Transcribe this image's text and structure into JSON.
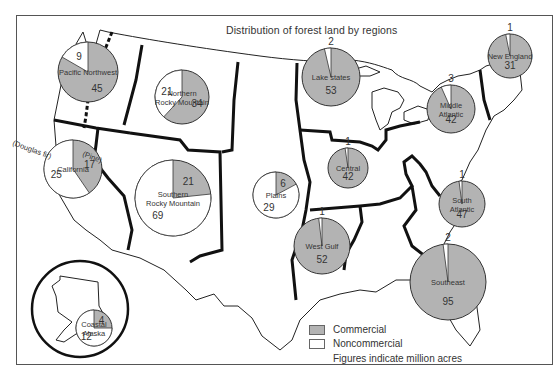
{
  "title": "Distribution of forest  land by regions",
  "legend": {
    "commercial_label": "Commercial",
    "noncommercial_label": "Noncommercial",
    "note": "Figures indicate million acres",
    "commercial_color": "#b3b3b3",
    "noncommercial_color": "#ffffff"
  },
  "annotations": {
    "douglas_fir": "(Douglas fir)",
    "pine": "(Pine)"
  },
  "chart_data": {
    "type": "pie",
    "title": "Distribution of forest land by regions",
    "units": "million acres",
    "legend": [
      "Commercial",
      "Noncommercial"
    ],
    "regions": [
      {
        "name": "Pacific Northwest",
        "label_lines": [
          "Pacific Northwest"
        ],
        "commercial": 45,
        "noncommercial": 9,
        "cx": 88,
        "cy": 72,
        "r": 30
      },
      {
        "name": "Northern Rocky Mountain",
        "label_lines": [
          "Northern",
          "Rocky Mountain"
        ],
        "commercial": 34,
        "noncommercial": 21,
        "cx": 182,
        "cy": 97,
        "r": 27
      },
      {
        "name": "Lake states",
        "label_lines": [
          "Lake states"
        ],
        "commercial": 53,
        "noncommercial": 2,
        "cx": 331,
        "cy": 77,
        "r": 29
      },
      {
        "name": "New England",
        "label_lines": [
          "New England"
        ],
        "commercial": 31,
        "noncommercial": 1,
        "cx": 510,
        "cy": 56,
        "r": 22
      },
      {
        "name": "Middle Atlantic",
        "label_lines": [
          "Middle",
          "Atlantic"
        ],
        "commercial": 42,
        "noncommercial": 3,
        "cx": 451,
        "cy": 109,
        "r": 24
      },
      {
        "name": "California",
        "label_lines": [
          "California"
        ],
        "commercial": 17,
        "noncommercial": 25,
        "cx": 73,
        "cy": 169,
        "r": 29
      },
      {
        "name": "Southern Rocky Mountain",
        "label_lines": [
          "Southern",
          "Rocky Mountain"
        ],
        "commercial": 21,
        "noncommercial": 69,
        "cx": 173,
        "cy": 198,
        "r": 38
      },
      {
        "name": "Plains",
        "label_lines": [
          "Plains"
        ],
        "commercial": 6,
        "noncommercial": 29,
        "cx": 276,
        "cy": 195,
        "r": 23
      },
      {
        "name": "Central",
        "label_lines": [
          "Central"
        ],
        "commercial": 42,
        "noncommercial": 1,
        "cx": 348,
        "cy": 168,
        "r": 20
      },
      {
        "name": "West Gulf",
        "label_lines": [
          "West Gulf"
        ],
        "commercial": 52,
        "noncommercial": 1,
        "cx": 322,
        "cy": 246,
        "r": 28
      },
      {
        "name": "South Atlantic",
        "label_lines": [
          "South",
          "Atlantic"
        ],
        "commercial": 47,
        "noncommercial": 1,
        "cx": 462,
        "cy": 204,
        "r": 23
      },
      {
        "name": "Southeast",
        "label_lines": [
          "Southeast"
        ],
        "commercial": 95,
        "noncommercial": 2,
        "cx": 448,
        "cy": 282,
        "r": 38
      },
      {
        "name": "Coastal Alaska",
        "label_lines": [
          "Coastal",
          "Alaska"
        ],
        "commercial": 4,
        "noncommercial": 12,
        "cx": 94,
        "cy": 328,
        "r": 18
      }
    ]
  }
}
